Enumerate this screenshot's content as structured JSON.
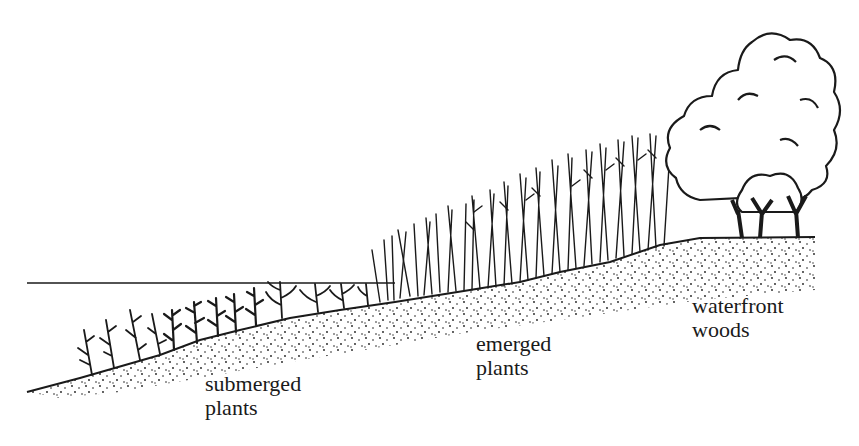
{
  "diagram": {
    "type": "cross-section illustration",
    "colors": {
      "ink": "#1a1a1a",
      "background": "#ffffff"
    },
    "water_line": {
      "x1": 27,
      "x2": 395,
      "y": 283
    },
    "ground_profile": [
      [
        27,
        392
      ],
      [
        80,
        378
      ],
      [
        160,
        355
      ],
      [
        200,
        340
      ],
      [
        240,
        330
      ],
      [
        290,
        318
      ],
      [
        340,
        310
      ],
      [
        395,
        302
      ],
      [
        470,
        290
      ],
      [
        520,
        282
      ],
      [
        560,
        272
      ],
      [
        610,
        262
      ],
      [
        660,
        245
      ],
      [
        700,
        238
      ],
      [
        815,
        237
      ]
    ],
    "zones": [
      {
        "id": "submerged",
        "line1": "submerged",
        "line2": "plants",
        "x": 205,
        "y": 372
      },
      {
        "id": "emerged",
        "line1": "emerged",
        "line2": "plants",
        "x": 476,
        "y": 332
      },
      {
        "id": "woods",
        "line1": "waterfront",
        "line2": "woods",
        "x": 692,
        "y": 294
      }
    ]
  }
}
